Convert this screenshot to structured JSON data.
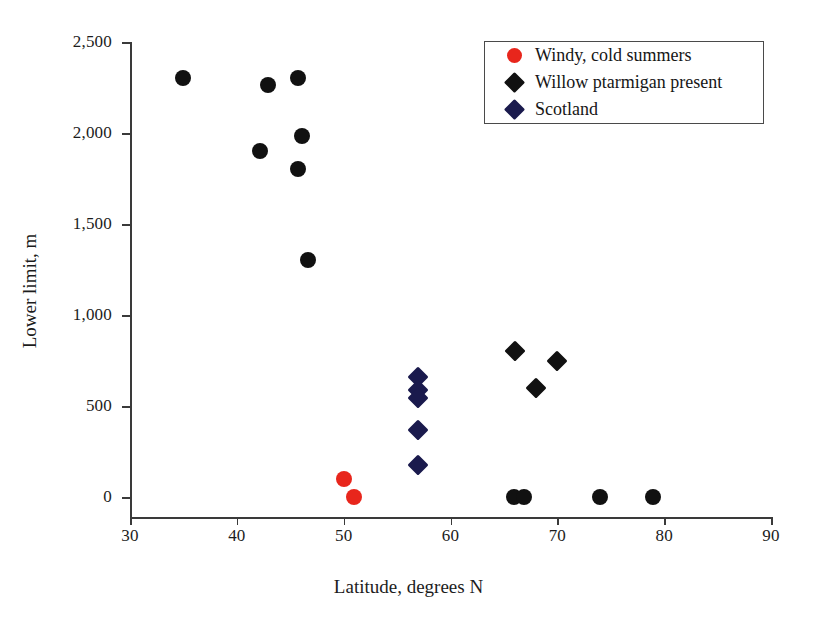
{
  "chart_data": {
    "type": "scatter",
    "title": "",
    "xlabel": "Latitude, degrees N",
    "ylabel": "Lower limit, m",
    "xlim": [
      30,
      90
    ],
    "ylim": [
      0,
      2500
    ],
    "xticks": [
      "30",
      "40",
      "50",
      "60",
      "70",
      "80",
      "90"
    ],
    "yticks": [
      "0",
      "500",
      "1,000",
      "1,500",
      "2,000",
      "2,500"
    ],
    "grid": false,
    "legend_position": "top-right",
    "series": [
      {
        "name": "Windy, cold summers",
        "marker": "circle",
        "color": "#E8261C",
        "points": [
          {
            "x": 50,
            "y": 100
          },
          {
            "x": 51,
            "y": 0
          }
        ]
      },
      {
        "name": "Willow ptarmigan present",
        "marker": "diamond",
        "color": "#111111",
        "points": [
          {
            "x": 66,
            "y": 800
          },
          {
            "x": 70,
            "y": 750
          },
          {
            "x": 68,
            "y": 600
          }
        ]
      },
      {
        "name": "Scotland",
        "marker": "diamond",
        "color": "#1A1A4D",
        "points": [
          {
            "x": 57,
            "y": 660
          },
          {
            "x": 57,
            "y": 590
          },
          {
            "x": 57,
            "y": 545
          },
          {
            "x": 57,
            "y": 370
          },
          {
            "x": 57,
            "y": 175
          }
        ]
      },
      {
        "name": "Other sites",
        "marker": "circle",
        "color": "#111111",
        "points": [
          {
            "x": 35,
            "y": 2300
          },
          {
            "x": 42.9,
            "y": 2265
          },
          {
            "x": 45.7,
            "y": 2300
          },
          {
            "x": 46.1,
            "y": 1985
          },
          {
            "x": 42.2,
            "y": 1900
          },
          {
            "x": 45.7,
            "y": 1800
          },
          {
            "x": 46.7,
            "y": 1300
          },
          {
            "x": 65.9,
            "y": 0
          },
          {
            "x": 66.9,
            "y": 0
          },
          {
            "x": 74,
            "y": 0
          },
          {
            "x": 79,
            "y": 0
          }
        ]
      }
    ]
  },
  "legend": {
    "entries": [
      {
        "label": "Windy, cold summers",
        "marker": "circle",
        "color": "#E8261C"
      },
      {
        "label": "Willow ptarmigan present",
        "marker": "diamond",
        "color": "#111111"
      },
      {
        "label": "Scotland",
        "marker": "diamond",
        "color": "#1A1A4D"
      }
    ]
  }
}
